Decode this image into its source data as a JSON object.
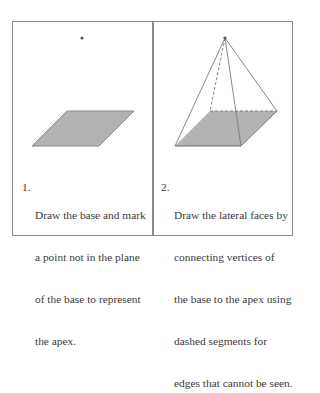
{
  "colors": {
    "frame": "#8a8a8a",
    "base_fill": "#b3b3b3",
    "base_edge": "#8a8a8a",
    "edge": "#7a7a7a",
    "apex": "#555555",
    "text": "#3a3a3a"
  },
  "panels": [
    {
      "step_number": "1.",
      "lines": [
        "Draw the base and mark",
        "a point not in the plane",
        "of the base to represent",
        "the apex."
      ]
    },
    {
      "step_number": "2.",
      "lines": [
        "Draw the lateral faces by",
        "connecting vertices of",
        "the base to the apex using",
        "dashed segments for",
        "edges that cannot be seen."
      ]
    }
  ]
}
